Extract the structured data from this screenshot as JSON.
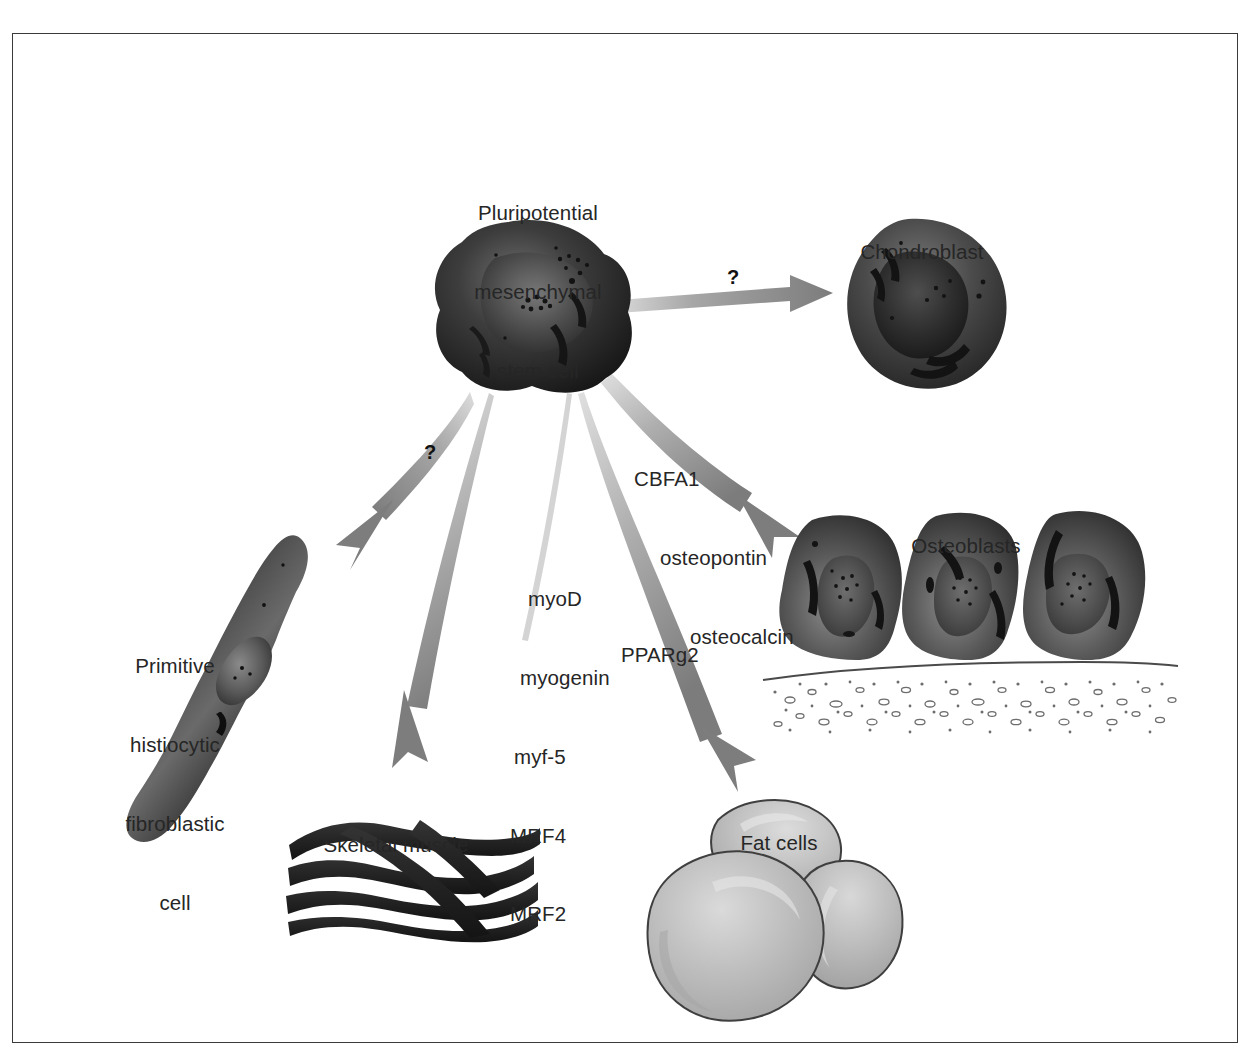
{
  "figure": {
    "kind": "biological-pathway-diagram",
    "border_color": "#3a3a3a",
    "background_color": "#ffffff"
  },
  "palette": {
    "cell_dark": "#2b2b2b",
    "cell_mid": "#4d4d4d",
    "cell_light": "#8f8f8f",
    "fat_fill": "#b9b9b9",
    "fat_highlight": "#d6d6d6",
    "muscle": "#2a2a2a",
    "arrow_gray": "#808080",
    "arrow_light": "#c9c9c9",
    "text": "#262626",
    "matrix_line": "#555555"
  },
  "labels": {
    "stem_cell": {
      "lines": [
        "Pluripotential",
        "mesenchymal",
        "stem cell"
      ],
      "x": 538,
      "y": 148
    },
    "chondroblast": {
      "lines": [
        "Chondroblast"
      ],
      "x": 922,
      "y": 187
    },
    "osteoblasts": {
      "lines": [
        "Osteoblasts"
      ],
      "x": 966,
      "y": 481
    },
    "fibroblast": {
      "lines": [
        "Primitive",
        "histiocytic",
        "fibroblastic",
        "cell"
      ],
      "x": 175,
      "y": 601
    },
    "skeletal_muscle": {
      "lines": [
        "Skeletal muscle"
      ],
      "x": 396,
      "y": 780
    },
    "fat_cells": {
      "lines": [
        "Fat cells"
      ],
      "x": 779,
      "y": 778
    }
  },
  "pathway_labels": {
    "osteoblast_genes": {
      "lines": [
        "CBFA1",
        "osteopontin",
        "osteocalcin"
      ],
      "x": 634,
      "y": 414
    },
    "muscle_genes": {
      "lines": [
        "myoD",
        "myogenin",
        "myf-5",
        "MRF4",
        "MRF2"
      ],
      "x": 510,
      "y": 534
    },
    "fat_gene": {
      "lines": [
        "PPARg2"
      ],
      "x": 621,
      "y": 590
    }
  },
  "arrows": [
    {
      "name": "arrow-to-chondroblast",
      "from": "stem cell",
      "to": "chondroblast",
      "annotation": "?",
      "annotation_x": 727,
      "annotation_y": 266,
      "style": "straight-tapered",
      "color": "#808080"
    },
    {
      "name": "arrow-to-fibroblast",
      "from": "stem cell",
      "to": "primitive histiocytic fibroblastic cell",
      "annotation": "?",
      "annotation_x": 424,
      "annotation_y": 441,
      "style": "curved-tapered",
      "color": "#808080"
    },
    {
      "name": "arrow-to-skeletal-muscle",
      "from": "stem cell",
      "to": "skeletal muscle",
      "annotation": "",
      "style": "curved-tapered-pair",
      "color": "#808080"
    },
    {
      "name": "arrow-to-fat-cells",
      "from": "stem cell",
      "to": "fat cells",
      "annotation": "",
      "style": "curved-tapered",
      "color": "#808080"
    },
    {
      "name": "arrow-to-osteoblasts",
      "from": "stem cell",
      "to": "osteoblasts",
      "annotation": "",
      "style": "curved-tapered",
      "color": "#808080"
    }
  ],
  "cells": {
    "stem_cell": {
      "name": "pluripotential-mesenchymal-stem-cell",
      "cx": 527,
      "cy": 307
    },
    "chondroblast": {
      "name": "chondroblast-cell",
      "cx": 920,
      "cy": 295
    },
    "fibroblast": {
      "name": "primitive-histiocytic-fibroblastic-cell",
      "cx": 205,
      "cy": 690
    },
    "osteoblast_1": {
      "name": "osteoblast-cell-1",
      "cx": 845,
      "cy": 585
    },
    "osteoblast_2": {
      "name": "osteoblast-cell-2",
      "cx": 965,
      "cy": 583
    },
    "osteoblast_3": {
      "name": "osteoblast-cell-3",
      "cx": 1085,
      "cy": 583
    },
    "bone_matrix": {
      "name": "bone-matrix-band",
      "x": 765,
      "y": 663
    },
    "muscle_fibers": {
      "name": "skeletal-muscle-fibers",
      "cx": 410,
      "cy": 875
    },
    "fat_cell_top": {
      "name": "fat-cell-top",
      "cx": 770,
      "cy": 840
    },
    "fat_cell_left": {
      "name": "fat-cell-left",
      "cx": 735,
      "cy": 920
    },
    "fat_cell_right": {
      "name": "fat-cell-right",
      "cx": 855,
      "cy": 925
    }
  }
}
